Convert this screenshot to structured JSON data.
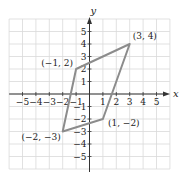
{
  "chart_data": {
    "type": "scatter",
    "title": "",
    "xlabel": "x",
    "ylabel": "y",
    "xlim": [
      -6,
      6
    ],
    "ylim": [
      -6,
      6
    ],
    "grid": true,
    "x_ticks": [
      -5,
      -4,
      -3,
      -2,
      -1,
      1,
      2,
      3,
      4,
      5
    ],
    "y_ticks": [
      -5,
      -4,
      -3,
      -2,
      -1,
      1,
      2,
      3,
      4,
      5
    ],
    "x_tick_labels": [
      "−5",
      "−4",
      "−3",
      "−2",
      "−1",
      "1",
      "2",
      "3",
      "4",
      "5"
    ],
    "y_tick_labels": [
      "−5",
      "−4",
      "−3",
      "−2",
      "−1",
      "1",
      "2",
      "3",
      "4",
      "5"
    ],
    "polygon": {
      "name": "parallelogram",
      "vertices": [
        {
          "x": 3,
          "y": 4,
          "label": "(3, 4)"
        },
        {
          "x": -1,
          "y": 2,
          "label": "(−1, 2)"
        },
        {
          "x": -2,
          "y": -3,
          "label": "(−2, −3)"
        },
        {
          "x": 1,
          "y": -2,
          "label": "(1, −2)"
        }
      ],
      "stroke_color": "#8c8c8c"
    }
  },
  "colors": {
    "grid": "#d9d9d9",
    "axis": "#333333",
    "polygon": "#8c8c8c",
    "text": "#222222"
  }
}
